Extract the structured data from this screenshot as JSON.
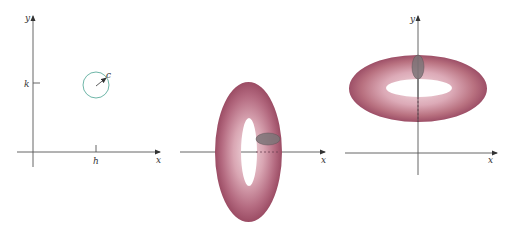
{
  "figures": [
    {
      "id": "circle-plot",
      "labels": {
        "y_axis": "y",
        "x_axis": "x",
        "h_tick": "h",
        "k_tick": "k",
        "radius": "c"
      },
      "colors": {
        "circle": "#5fae9e"
      }
    },
    {
      "id": "torus-about-y-rotated",
      "labels": {
        "x_axis": "x"
      },
      "colors": {
        "torus": "#a8576f",
        "torus_highlight": "#e7c3cc",
        "cross_section": "#7d7478"
      }
    },
    {
      "id": "torus-about-x",
      "labels": {
        "y_axis": "y",
        "x_axis": "x"
      },
      "colors": {
        "torus": "#a8576f",
        "torus_highlight": "#e7c3cc",
        "cross_section": "#7d7478"
      }
    }
  ]
}
